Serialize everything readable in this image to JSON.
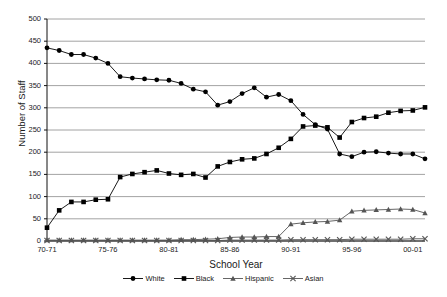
{
  "chart_data": {
    "type": "line",
    "title": "",
    "xlabel": "School Year",
    "ylabel": "Number of Staff",
    "ylim": [
      0,
      500
    ],
    "ytick_step": 50,
    "grid": true,
    "legend_position": "bottom",
    "x": [
      "70-71",
      "71-72",
      "72-73",
      "73-74",
      "74-75",
      "75-76",
      "76-77",
      "77-78",
      "78-79",
      "79-80",
      "80-81",
      "81-82",
      "82-83",
      "83-84",
      "84-85",
      "85-86",
      "86-87",
      "87-88",
      "88-89",
      "89-90",
      "90-91",
      "91-92",
      "92-93",
      "93-94",
      "94-95",
      "95-96",
      "96-97",
      "97-98",
      "98-99",
      "99-00",
      "00-01",
      "01-02"
    ],
    "xtick_labels": [
      "70-71",
      "75-76",
      "80-81",
      "85-86",
      "90-91",
      "95-96",
      "00-01"
    ],
    "xtick_indices": [
      0,
      5,
      10,
      15,
      20,
      25,
      30
    ],
    "yticks": [
      0,
      50,
      100,
      150,
      200,
      250,
      300,
      350,
      400,
      450,
      500
    ],
    "series": [
      {
        "name": "White",
        "marker": "circle",
        "color": "#000000",
        "values": [
          435,
          429,
          420,
          420,
          412,
          400,
          370,
          367,
          365,
          363,
          362,
          355,
          342,
          336,
          306,
          314,
          332,
          345,
          324,
          330,
          316,
          285,
          262,
          252,
          196,
          190,
          200,
          201,
          198,
          196,
          196,
          185
        ]
      },
      {
        "name": "Black",
        "marker": "square",
        "color": "#000000",
        "values": [
          30,
          69,
          88,
          88,
          93,
          94,
          144,
          151,
          155,
          159,
          152,
          149,
          151,
          143,
          168,
          178,
          184,
          186,
          196,
          210,
          230,
          258,
          260,
          256,
          233,
          268,
          277,
          280,
          289,
          293,
          294,
          301
        ]
      },
      {
        "name": "Hispanic",
        "marker": "triangle",
        "color": "#555555",
        "values": [
          2,
          2,
          2,
          2,
          2,
          2,
          2,
          2,
          2,
          2,
          2,
          3,
          3,
          4,
          5,
          8,
          9,
          9,
          10,
          10,
          38,
          41,
          43,
          44,
          47,
          67,
          69,
          70,
          71,
          72,
          71,
          63
        ]
      },
      {
        "name": "Asian",
        "marker": "x",
        "color": "#555555",
        "values": [
          1,
          1,
          1,
          1,
          1,
          1,
          1,
          1,
          1,
          1,
          1,
          1,
          1,
          1,
          1,
          2,
          2,
          2,
          2,
          2,
          3,
          3,
          3,
          3,
          3,
          4,
          4,
          4,
          4,
          4,
          5,
          5
        ]
      }
    ]
  },
  "axis": {
    "y_title": "Number of Staff",
    "x_title": "School Year"
  },
  "legend": {
    "items": [
      {
        "label": "White",
        "marker": "circle-marker"
      },
      {
        "label": "Black",
        "marker": "square-marker"
      },
      {
        "label": "Hispanic",
        "marker": "triangle-marker"
      },
      {
        "label": "Asian",
        "marker": "x-marker"
      }
    ]
  }
}
